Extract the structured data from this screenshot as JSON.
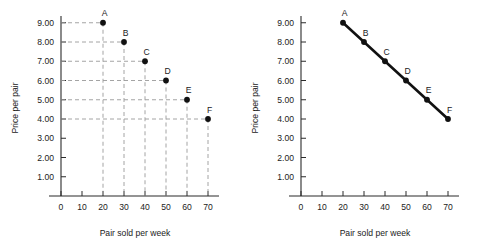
{
  "figure": {
    "panels": [
      {
        "id": "left",
        "name": "scatter-with-gridlines",
        "x_title": "Pair sold per week",
        "y_title": "Price per pair"
      },
      {
        "id": "right",
        "name": "demand-curve-line",
        "x_title": "Pair sold per week",
        "y_title": "Price per pair"
      }
    ]
  },
  "chart_data": [
    {
      "type": "scatter",
      "title": "",
      "xlabel": "Pair sold per week",
      "ylabel": "Price per pair",
      "x": [
        20,
        30,
        40,
        50,
        60,
        70
      ],
      "values": [
        9.0,
        8.0,
        7.0,
        6.0,
        5.0,
        4.0
      ],
      "point_labels": [
        "A",
        "B",
        "C",
        "D",
        "E",
        "F"
      ],
      "xlim": [
        0,
        75
      ],
      "ylim": [
        0,
        9.6
      ],
      "xticks": [
        0,
        10,
        20,
        30,
        40,
        50,
        60,
        70
      ],
      "xtick_labels": [
        "0",
        "10",
        "20",
        "30",
        "40",
        "50",
        "60",
        "70"
      ],
      "yticks": [
        1,
        2,
        3,
        4,
        5,
        6,
        7,
        8,
        9
      ],
      "ytick_labels": [
        "1.00",
        "2.00",
        "3.00",
        "4.00",
        "5.00",
        "6.00",
        "7.00",
        "8.00",
        "9.00"
      ],
      "grid": "dashed-dropline-to-axes",
      "legend": "none"
    },
    {
      "type": "line",
      "title": "",
      "xlabel": "Pair sold per week",
      "ylabel": "Price per pair",
      "x": [
        20,
        30,
        40,
        50,
        60,
        70
      ],
      "values": [
        9.0,
        8.0,
        7.0,
        6.0,
        5.0,
        4.0
      ],
      "point_labels": [
        "A",
        "B",
        "C",
        "D",
        "E",
        "F"
      ],
      "xlim": [
        0,
        75
      ],
      "ylim": [
        0,
        9.6
      ],
      "xticks": [
        0,
        10,
        20,
        30,
        40,
        50,
        60,
        70
      ],
      "xtick_labels": [
        "0",
        "10",
        "20",
        "30",
        "40",
        "50",
        "60",
        "70"
      ],
      "yticks": [
        1,
        2,
        3,
        4,
        5,
        6,
        7,
        8,
        9
      ],
      "ytick_labels": [
        "1.00",
        "2.00",
        "3.00",
        "4.00",
        "5.00",
        "6.00",
        "7.00",
        "8.00",
        "9.00"
      ],
      "grid": "off",
      "legend": "none"
    }
  ]
}
